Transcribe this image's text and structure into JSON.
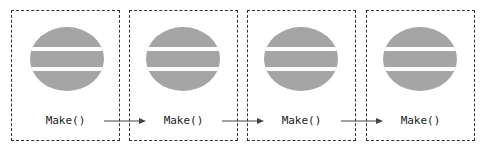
{
  "diagram": {
    "colors": {
      "shape_fill": "#a5a5a5",
      "border": "#333333",
      "text": "#222222",
      "arrow": "#444444"
    },
    "stages": [
      {
        "label": "Make()",
        "icon": "hamburger-icon"
      },
      {
        "label": "Make()",
        "icon": "hamburger-icon"
      },
      {
        "label": "Make()",
        "icon": "hamburger-icon"
      },
      {
        "label": "Make()",
        "icon": "hamburger-icon"
      }
    ],
    "arrows": [
      {
        "from": 1,
        "to": 2,
        "icon": "arrow-right-icon"
      },
      {
        "from": 2,
        "to": 3,
        "icon": "arrow-right-icon"
      },
      {
        "from": 3,
        "to": 4,
        "icon": "arrow-right-icon"
      }
    ]
  }
}
